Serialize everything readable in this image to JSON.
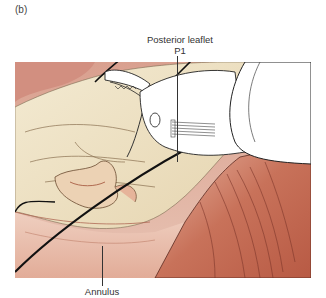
{
  "figure": {
    "panel_label": "(b)",
    "labels": {
      "top_line1": "Posterior leaflet",
      "top_line2": "P1",
      "bottom": "Annulus"
    },
    "colors": {
      "tissue_cream": "#efe4c8",
      "tissue_pink": "#e4a590",
      "tissue_red": "#c8664e",
      "instrument": "#ffffff",
      "outline": "#222222"
    }
  }
}
